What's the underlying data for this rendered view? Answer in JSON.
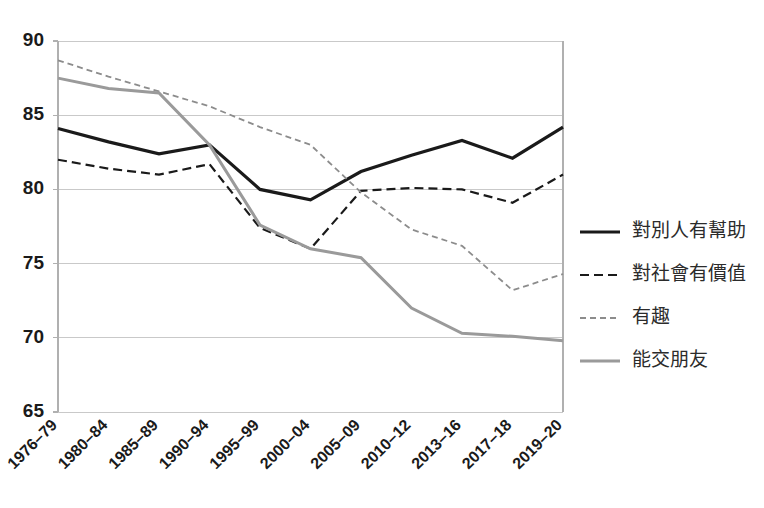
{
  "chart_data": {
    "type": "line",
    "title": "",
    "xlabel": "",
    "ylabel": "",
    "ylim": [
      65,
      90
    ],
    "ytick_values": [
      65,
      70,
      75,
      80,
      85,
      90
    ],
    "ytick_labels": [
      "65",
      "70",
      "75",
      "80",
      "85",
      "90"
    ],
    "grid": true,
    "legend_position": "right",
    "categories": [
      "1976–79",
      "1980–84",
      "1985–89",
      "1990–94",
      "1995–99",
      "2000–04",
      "2005–09",
      "2010–12",
      "2013–16",
      "2017–18",
      "2019–20"
    ],
    "series": [
      {
        "name": "對別人有幫助",
        "style": "solid",
        "color": "#1a1a1a",
        "width": 3.2,
        "dash": "",
        "values": [
          84.1,
          83.2,
          82.4,
          83.0,
          80.0,
          79.3,
          81.2,
          82.3,
          83.3,
          82.1,
          84.2
        ]
      },
      {
        "name": "對社會有價值",
        "style": "dashed",
        "color": "#1a1a1a",
        "width": 2.2,
        "dash": "9,5",
        "values": [
          82.0,
          81.4,
          81.0,
          81.7,
          77.4,
          76.0,
          79.9,
          80.1,
          80.0,
          79.1,
          81.0
        ]
      },
      {
        "name": "有趣",
        "style": "fine-dashed",
        "color": "#8c8c8c",
        "width": 1.8,
        "dash": "6,4",
        "values": [
          88.7,
          87.6,
          86.6,
          85.6,
          84.2,
          83.0,
          79.8,
          77.3,
          76.2,
          73.2,
          74.3
        ]
      },
      {
        "name": "能交朋友",
        "style": "solid",
        "color": "#9a9a9a",
        "width": 3.0,
        "dash": "",
        "values": [
          87.5,
          86.8,
          86.5,
          83.0,
          77.6,
          76.0,
          75.4,
          72.0,
          70.3,
          70.1,
          69.8
        ]
      }
    ]
  },
  "colors": {
    "gridline": "#c9c9c9",
    "axis": "#b0b0b0",
    "text": "#1a1a1a",
    "legend_text": "#2b2b2b"
  },
  "legend": {
    "items": [
      {
        "label": "對別人有幫助"
      },
      {
        "label": "對社會有價值"
      },
      {
        "label": "有趣"
      },
      {
        "label": "能交朋友"
      }
    ]
  }
}
